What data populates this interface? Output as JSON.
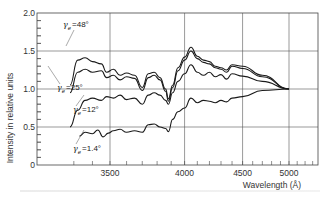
{
  "chart_data": {
    "type": "line",
    "title": "",
    "xlabel": "Wavelength (Å)",
    "ylabel": "Intensity in relative units",
    "xlim": [
      3200,
      5500
    ],
    "ylim": [
      0,
      2.0
    ],
    "x_scale": "reciprocal (wavenumber-like, non-linear)",
    "grid": true,
    "x_ticks": [
      3500,
      4000,
      4500,
      5000
    ],
    "y_ticks": [
      0,
      0.5,
      1.0,
      1.5,
      2.0
    ],
    "y_tick_labels": [
      "0",
      "0.5",
      "1.0",
      "1.5",
      "2.0"
    ],
    "legend": "inline labels with leader lines",
    "series": [
      {
        "name": "γe = 48°",
        "label_greek": "γ",
        "label_sub": "e",
        "label_value": "=48°",
        "points": [
          [
            3280,
            1.05
          ],
          [
            3320,
            1.38
          ],
          [
            3360,
            1.41
          ],
          [
            3400,
            1.36
          ],
          [
            3450,
            1.33
          ],
          [
            3480,
            1.22
          ],
          [
            3520,
            1.26
          ],
          [
            3560,
            1.18
          ],
          [
            3600,
            1.21
          ],
          [
            3650,
            1.18
          ],
          [
            3700,
            1.02
          ],
          [
            3740,
            1.2
          ],
          [
            3780,
            1.22
          ],
          [
            3820,
            1.15
          ],
          [
            3860,
            1.0
          ],
          [
            3880,
            0.87
          ],
          [
            3910,
            1.05
          ],
          [
            3950,
            1.28
          ],
          [
            4000,
            1.42
          ],
          [
            4050,
            1.55
          ],
          [
            4100,
            1.43
          ],
          [
            4150,
            1.38
          ],
          [
            4200,
            1.36
          ],
          [
            4250,
            1.3
          ],
          [
            4300,
            1.28
          ],
          [
            4350,
            1.25
          ],
          [
            4400,
            1.32
          ],
          [
            4500,
            1.3
          ],
          [
            4700,
            1.18
          ],
          [
            5000,
            1.0
          ]
        ]
      },
      {
        "name": "γe = 25°",
        "label_greek": "γ",
        "label_sub": "e",
        "label_value": "=25°",
        "points": [
          [
            3280,
            0.95
          ],
          [
            3320,
            1.22
          ],
          [
            3360,
            1.26
          ],
          [
            3400,
            1.22
          ],
          [
            3450,
            1.24
          ],
          [
            3480,
            1.15
          ],
          [
            3520,
            1.18
          ],
          [
            3560,
            1.12
          ],
          [
            3600,
            1.16
          ],
          [
            3650,
            1.14
          ],
          [
            3700,
            0.98
          ],
          [
            3740,
            1.15
          ],
          [
            3780,
            1.18
          ],
          [
            3820,
            1.12
          ],
          [
            3860,
            0.97
          ],
          [
            3880,
            0.84
          ],
          [
            3910,
            1.02
          ],
          [
            3950,
            1.24
          ],
          [
            4000,
            1.38
          ],
          [
            4050,
            1.5
          ],
          [
            4100,
            1.4
          ],
          [
            4150,
            1.35
          ],
          [
            4200,
            1.33
          ],
          [
            4250,
            1.28
          ],
          [
            4300,
            1.26
          ],
          [
            4350,
            1.22
          ],
          [
            4400,
            1.3
          ],
          [
            4500,
            1.27
          ],
          [
            4700,
            1.16
          ],
          [
            5000,
            1.0
          ]
        ]
      },
      {
        "name": "γe = 12°",
        "label_greek": "γ",
        "label_sub": "e",
        "label_value": "=12°",
        "points": [
          [
            3280,
            0.5
          ],
          [
            3320,
            0.72
          ],
          [
            3360,
            0.85
          ],
          [
            3400,
            0.88
          ],
          [
            3450,
            0.85
          ],
          [
            3480,
            0.9
          ],
          [
            3520,
            0.88
          ],
          [
            3560,
            0.92
          ],
          [
            3600,
            0.86
          ],
          [
            3650,
            0.88
          ],
          [
            3700,
            0.8
          ],
          [
            3740,
            0.92
          ],
          [
            3780,
            0.95
          ],
          [
            3820,
            0.92
          ],
          [
            3860,
            0.85
          ],
          [
            3880,
            0.8
          ],
          [
            3910,
            0.95
          ],
          [
            3950,
            1.1
          ],
          [
            4000,
            1.2
          ],
          [
            4050,
            1.32
          ],
          [
            4100,
            1.22
          ],
          [
            4150,
            1.18
          ],
          [
            4200,
            1.22
          ],
          [
            4250,
            1.16
          ],
          [
            4300,
            1.19
          ],
          [
            4350,
            1.13
          ],
          [
            4400,
            1.2
          ],
          [
            4500,
            1.17
          ],
          [
            4700,
            1.1
          ],
          [
            5000,
            1.0
          ]
        ]
      },
      {
        "name": "γe = 1.4°",
        "label_greek": "γ",
        "label_sub": "e",
        "label_value": "=1.4°",
        "points": [
          [
            3330,
            0.38
          ],
          [
            3360,
            0.43
          ],
          [
            3400,
            0.41
          ],
          [
            3430,
            0.46
          ],
          [
            3460,
            0.37
          ],
          [
            3490,
            0.42
          ],
          [
            3520,
            0.45
          ],
          [
            3560,
            0.47
          ],
          [
            3600,
            0.43
          ],
          [
            3650,
            0.45
          ],
          [
            3700,
            0.43
          ],
          [
            3740,
            0.53
          ],
          [
            3780,
            0.54
          ],
          [
            3820,
            0.5
          ],
          [
            3860,
            0.48
          ],
          [
            3880,
            0.44
          ],
          [
            3910,
            0.6
          ],
          [
            3950,
            0.7
          ],
          [
            4000,
            0.75
          ],
          [
            4050,
            0.88
          ],
          [
            4100,
            0.82
          ],
          [
            4150,
            0.85
          ],
          [
            4200,
            0.84
          ],
          [
            4250,
            0.82
          ],
          [
            4300,
            0.85
          ],
          [
            4350,
            0.83
          ],
          [
            4400,
            0.88
          ],
          [
            4500,
            0.9
          ],
          [
            4700,
            0.98
          ],
          [
            5000,
            1.0
          ]
        ]
      }
    ]
  },
  "axes": {
    "y_title": "Intensity in relative units",
    "x_title": "Wavelength (Å)"
  }
}
